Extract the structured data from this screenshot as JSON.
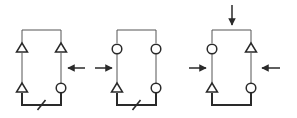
{
  "colors": {
    "background": "#ffffff",
    "stroke": "#2a2a2a",
    "thin_stroke": "#555555"
  },
  "diagrams": [
    {
      "id": "config-1",
      "left_x": 22,
      "right_x": 61,
      "top_y": 30,
      "bottom_y": 105,
      "nodes": [
        {
          "position": "top-left",
          "shape": "triangle",
          "y": 48
        },
        {
          "position": "top-right",
          "shape": "triangle",
          "y": 48
        },
        {
          "position": "bottom-left",
          "shape": "triangle",
          "y": 88
        },
        {
          "position": "bottom-right",
          "shape": "circle",
          "y": 88
        }
      ],
      "bottom_slash": true,
      "arrows": [
        {
          "direction": "left",
          "x1": 85,
          "y1": 68,
          "x2": 68,
          "y2": 68
        }
      ]
    },
    {
      "id": "config-2",
      "left_x": 117,
      "right_x": 156,
      "top_y": 30,
      "bottom_y": 105,
      "nodes": [
        {
          "position": "top-left",
          "shape": "circle",
          "y": 49
        },
        {
          "position": "top-right",
          "shape": "circle",
          "y": 49
        },
        {
          "position": "bottom-left",
          "shape": "triangle",
          "y": 88
        },
        {
          "position": "bottom-right",
          "shape": "circle",
          "y": 88
        }
      ],
      "bottom_slash": true,
      "arrows": [
        {
          "direction": "right",
          "x1": 95,
          "y1": 68,
          "x2": 112,
          "y2": 68
        }
      ]
    },
    {
      "id": "config-3",
      "left_x": 212,
      "right_x": 251,
      "top_y": 30,
      "bottom_y": 105,
      "nodes": [
        {
          "position": "top-left",
          "shape": "circle",
          "y": 49
        },
        {
          "position": "top-right",
          "shape": "triangle",
          "y": 48
        },
        {
          "position": "bottom-left",
          "shape": "triangle",
          "y": 88
        },
        {
          "position": "bottom-right",
          "shape": "circle",
          "y": 88
        }
      ],
      "bottom_slash": false,
      "arrows": [
        {
          "direction": "down",
          "x1": 232,
          "y1": 5,
          "x2": 232,
          "y2": 25
        },
        {
          "direction": "right",
          "x1": 189,
          "y1": 68,
          "x2": 206,
          "y2": 68
        },
        {
          "direction": "left",
          "x1": 280,
          "y1": 68,
          "x2": 262,
          "y2": 68
        }
      ]
    }
  ]
}
